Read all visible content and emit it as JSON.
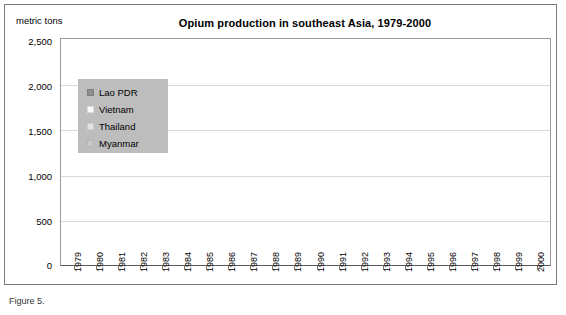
{
  "figure": {
    "title": "Opium production in southeast Asia, 1979-2000",
    "y_axis_caption": "metric tons",
    "caption_fragment": "Figure 5."
  },
  "legend": {
    "items": [
      {
        "label": "Lao PDR",
        "color": "#8e8e8e"
      },
      {
        "label": "Vietnam",
        "color": "#f2f2f2"
      },
      {
        "label": "Thailand",
        "color": "#e4e4e4"
      },
      {
        "label": "Myanmar",
        "color": "#c9c9c9"
      }
    ]
  },
  "chart_data": {
    "type": "bar",
    "stacked": true,
    "title": "Opium production in southeast Asia, 1979-2000",
    "xlabel": "",
    "ylabel": "metric tons",
    "ylim": [
      0,
      2500
    ],
    "yticks": [
      "0",
      "500",
      "1,000",
      "1,500",
      "2,000",
      "2,500"
    ],
    "ytick_values": [
      0,
      500,
      1000,
      1500,
      2000,
      2500
    ],
    "grid": "horizontal",
    "legend_position": "inside-top-left",
    "categories": [
      "1979",
      "1980",
      "1981",
      "1982",
      "1983",
      "1984",
      "1985",
      "1986",
      "1987",
      "1988",
      "1989",
      "1990",
      "1991",
      "1992",
      "1993",
      "1994",
      "1995",
      "1996",
      "1997",
      "1998",
      "1999",
      "2000"
    ],
    "series": [
      {
        "name": "Myanmar",
        "color": "#c9c9c9",
        "values": [
          160,
          185,
          600,
          680,
          650,
          790,
          570,
          980,
          1025,
          1125,
          1600,
          1620,
          1660,
          1565,
          1785,
          1585,
          1570,
          1760,
          1675,
          1300,
          895,
          1085
        ]
      },
      {
        "name": "Thailand",
        "color": "#e4e4e4",
        "values": [
          8,
          8,
          8,
          8,
          8,
          8,
          8,
          8,
          8,
          8,
          8,
          8,
          8,
          8,
          8,
          5,
          5,
          5,
          5,
          5,
          5,
          5
        ]
      },
      {
        "name": "Vietnam",
        "color": "#f2f2f2",
        "values": [
          5,
          5,
          5,
          5,
          5,
          5,
          5,
          5,
          5,
          5,
          5,
          5,
          5,
          5,
          5,
          5,
          5,
          5,
          5,
          5,
          5,
          5
        ]
      },
      {
        "name": "Lao PDR",
        "color": "#8e8e8e",
        "values": [
          10,
          10,
          30,
          25,
          20,
          25,
          25,
          205,
          210,
          110,
          310,
          200,
          325,
          125,
          95,
          85,
          180,
          140,
          140,
          130,
          95,
          160
        ]
      }
    ],
    "totals": [
      183,
      208,
      643,
      718,
      683,
      828,
      608,
      1198,
      1248,
      1248,
      1923,
      1833,
      1998,
      1703,
      1893,
      1680,
      1760,
      1910,
      1825,
      1440,
      1000,
      1255
    ]
  }
}
